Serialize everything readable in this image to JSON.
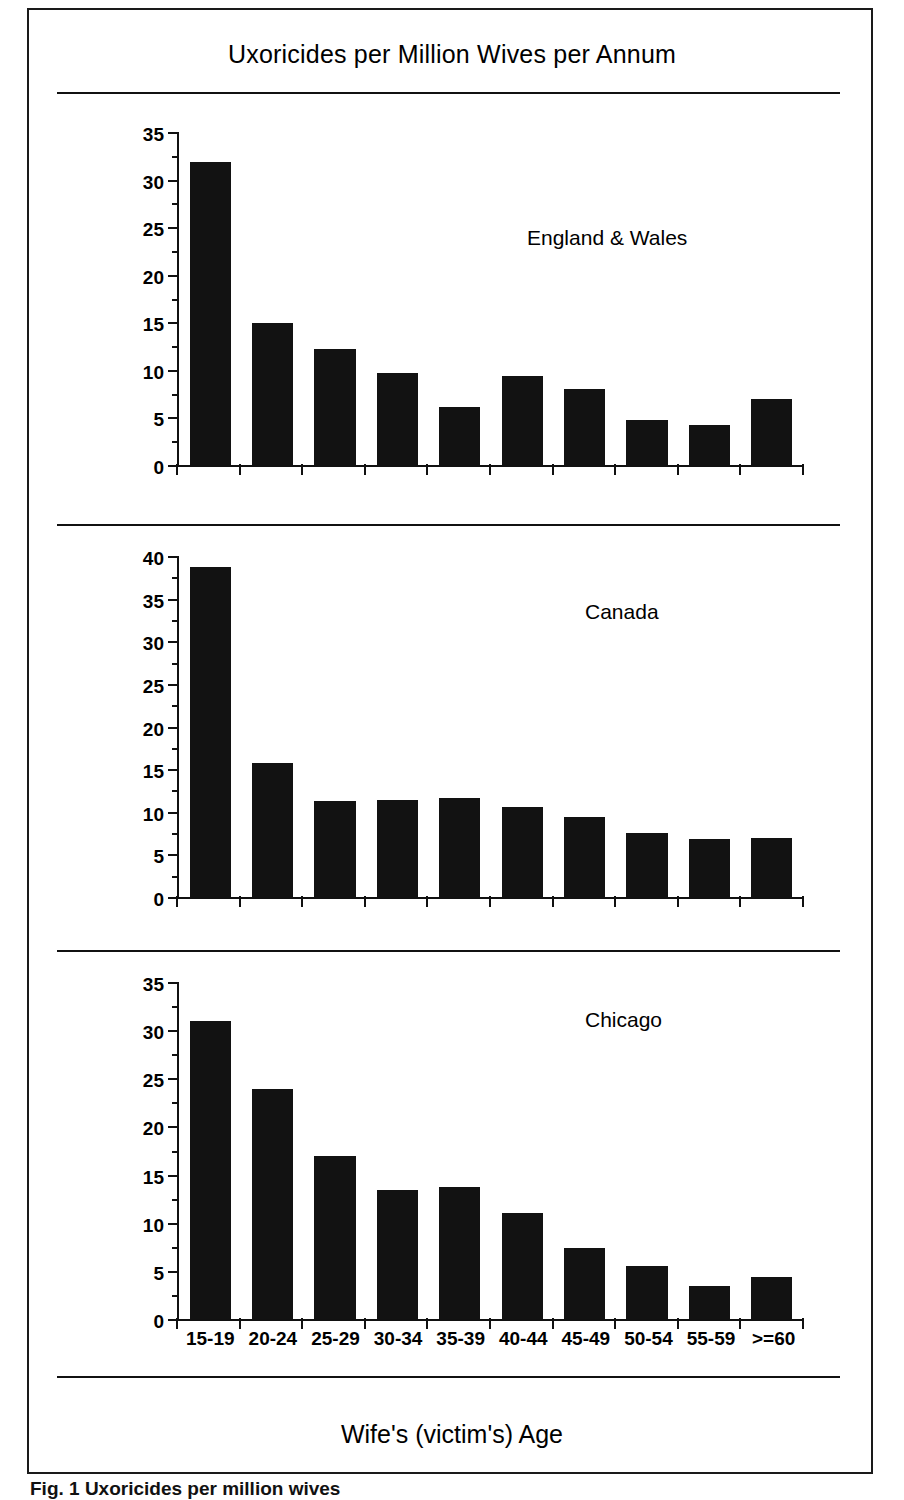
{
  "figure": {
    "title": "Uxoricides per Million Wives per Annum",
    "xaxis_caption": "Wife's (victim's) Age",
    "caption": "Fig. 1  Uxoricides per million wives"
  },
  "chart_data": {
    "type": "bar",
    "title": "Uxoricides per Million Wives per Annum",
    "xlabel": "Wife's (victim's) Age",
    "ylabel": "",
    "grid": false,
    "legend": "none",
    "categories": [
      "15-19",
      "20-24",
      "25-29",
      "30-34",
      "35-39",
      "40-44",
      "45-49",
      "50-54",
      "55-59",
      ">=60"
    ],
    "panels": [
      {
        "label": "England & Wales",
        "ylim": [
          0,
          35
        ],
        "yticks": [
          0,
          5,
          10,
          15,
          20,
          25,
          30,
          35
        ],
        "ytick_step": 5,
        "minor_tick_step": 2.5,
        "values": [
          32.0,
          15.0,
          12.3,
          9.7,
          6.1,
          9.4,
          8.0,
          4.8,
          4.2,
          7.0
        ]
      },
      {
        "label": "Canada",
        "ylim": [
          0,
          40
        ],
        "yticks": [
          0,
          5,
          10,
          15,
          20,
          25,
          30,
          35,
          40
        ],
        "ytick_step": 5,
        "minor_tick_step": 2.5,
        "values": [
          38.9,
          15.8,
          11.3,
          11.5,
          11.7,
          10.6,
          9.5,
          7.6,
          6.8,
          7.0
        ]
      },
      {
        "label": "Chicago",
        "ylim": [
          0,
          35
        ],
        "yticks": [
          0,
          5,
          10,
          15,
          20,
          25,
          30,
          35
        ],
        "ytick_step": 5,
        "minor_tick_step": 2.5,
        "values": [
          31.1,
          24.0,
          17.0,
          13.5,
          13.8,
          11.1,
          7.4,
          5.5,
          3.5,
          4.4
        ]
      }
    ]
  },
  "style": {
    "bar_color": "#121212",
    "axis_color": "#111111",
    "background": "#ffffff"
  }
}
